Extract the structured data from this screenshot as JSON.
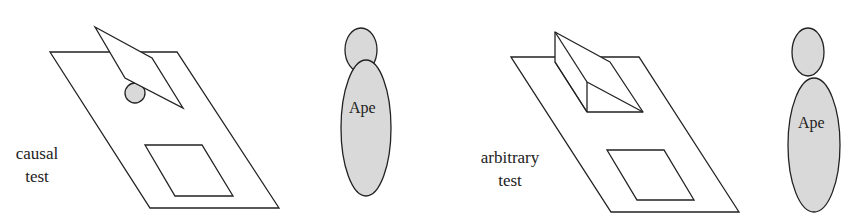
{
  "panels": [
    {
      "label_line1": "causal",
      "label_line2": "test",
      "figure_label": "Ape",
      "object": "tilted flap with ball"
    },
    {
      "label_line1": "arbitrary",
      "label_line2": "test",
      "figure_label": "Ape",
      "object": "wedge block"
    }
  ],
  "colors": {
    "stroke": "#222222",
    "fill_gray": "#d9d9d9"
  }
}
